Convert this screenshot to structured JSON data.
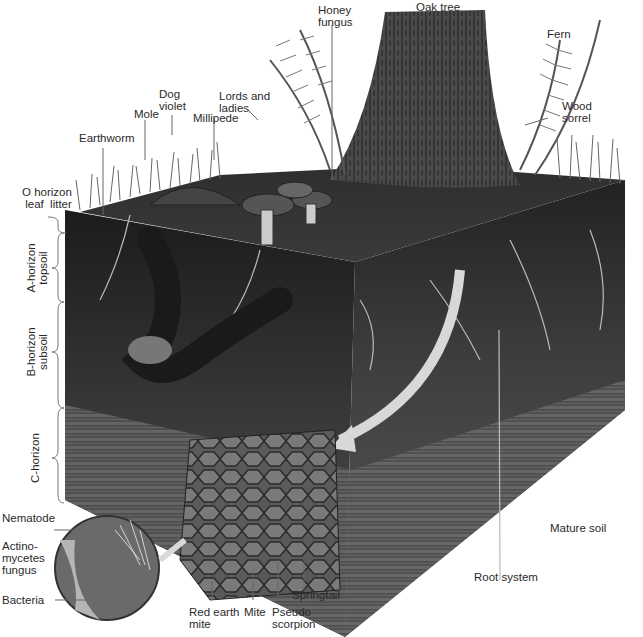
{
  "diagram": {
    "type": "soil-profile-illustration",
    "labels": {
      "honey_fungus": "Honey\nfungus",
      "oak_tree": "Oak tree",
      "fern": "Fern",
      "dog_violet": "Dog\nviolet",
      "lords_and_ladies": "Lords and\nladies",
      "mole": "Mole",
      "millipede": "Millipede",
      "wood_sorrel": "Wood\nsorrel",
      "earthworm": "Earthworm",
      "o_horizon": "O horizon\nleaf  litter",
      "a_horizon": "A-horizon\ntopsoil",
      "b_horizon": "B-horizon\nsubsoil",
      "c_horizon": "C-horizon",
      "nematode": "Nematode",
      "actinomycetes": "Actino-\nmycetes\nfungus",
      "bacteria": "Bacteria",
      "red_earth_mite": "Red earth\nmite",
      "mite": "Mite",
      "pseudo_scorpion": "Pseudo\nscorpion",
      "springtail": "Springtail",
      "root_system": "Root system",
      "mature_soil": "Mature soil"
    },
    "horizons": [
      "O horizon (leaf litter)",
      "A-horizon (topsoil)",
      "B-horizon (subsoil)",
      "C-horizon"
    ]
  }
}
